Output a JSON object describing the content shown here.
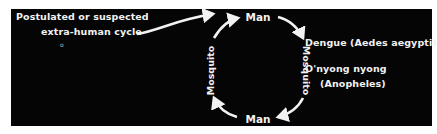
{
  "diagram": {
    "type": "transmission-cycle",
    "extra_cycle_label": {
      "line1": "Postulated or suspected",
      "line2": "extra-human cycle"
    },
    "cycle_nodes": [
      {
        "id": "top",
        "label": "Man"
      },
      {
        "id": "right",
        "label": "Mosquito"
      },
      {
        "id": "bottom",
        "label": "Man"
      },
      {
        "id": "left",
        "label": "Mosquito"
      }
    ],
    "cycle_direction": "clockwise",
    "diseases": [
      {
        "name": "Dengue (Aedes aegypti)"
      },
      {
        "name": "O'nyong nyong",
        "vector": "(Anopheles)"
      }
    ],
    "colors": {
      "background": "#050505",
      "foreground": "#f2f2f2",
      "margin": "#ffffff"
    }
  }
}
